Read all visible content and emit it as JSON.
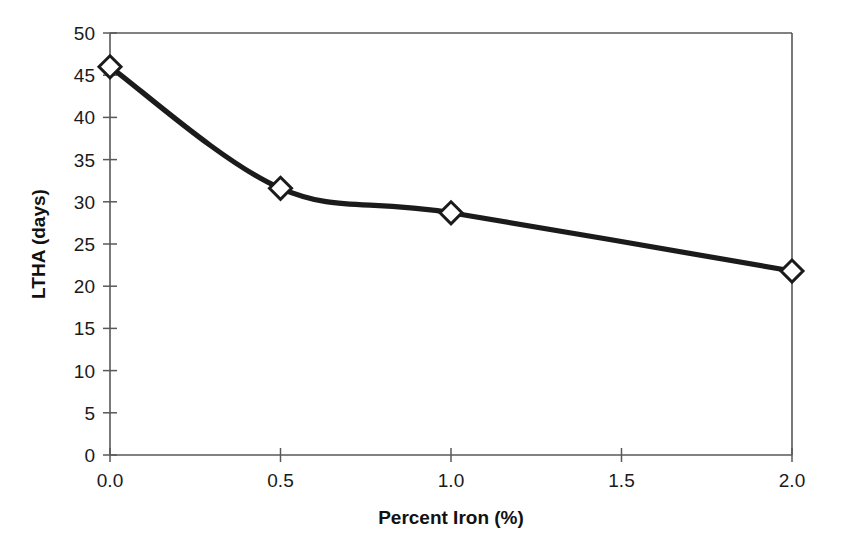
{
  "chart_data": {
    "type": "line",
    "title": "",
    "xlabel": "Percent Iron (%)",
    "ylabel": "LTHA (days)",
    "x": [
      0.0,
      0.5,
      1.0,
      2.0
    ],
    "values": [
      46.0,
      31.6,
      28.7,
      21.8
    ],
    "series": [
      {
        "name": "LTHA",
        "x": [
          0.0,
          0.5,
          1.0,
          2.0
        ],
        "values": [
          46.0,
          31.6,
          28.7,
          21.8
        ]
      }
    ],
    "xlim": [
      0.0,
      2.0
    ],
    "ylim": [
      0,
      50
    ],
    "xticks": [
      0.0,
      0.5,
      1.0,
      1.5,
      2.0
    ],
    "xtick_labels": [
      "0.0",
      "0.5",
      "1.0",
      "1.5",
      "2.0"
    ],
    "yticks": [
      0,
      5,
      10,
      15,
      20,
      25,
      30,
      35,
      40,
      45,
      50
    ],
    "ytick_labels": [
      "0",
      "5",
      "10",
      "15",
      "20",
      "25",
      "30",
      "35",
      "40",
      "45",
      "50"
    ],
    "grid": false,
    "legend": false,
    "legend_position": "none",
    "marker": "open-diamond",
    "line_color": "#1b1b1b",
    "marker_fill": "#ffffff",
    "marker_edge": "#1b1b1b",
    "frame_color": "#58585a",
    "background": "#ffffff",
    "annotations": []
  }
}
